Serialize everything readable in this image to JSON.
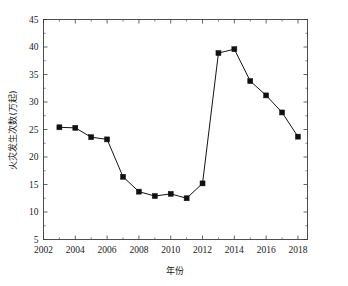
{
  "chart_data": {
    "type": "line",
    "title": "",
    "xlabel": "年份",
    "ylabel": "火灾发生次数(万起)",
    "x": [
      2003,
      2004,
      2005,
      2006,
      2007,
      2008,
      2009,
      2010,
      2011,
      2012,
      2013,
      2014,
      2015,
      2016,
      2017,
      2018
    ],
    "values": [
      25.4,
      25.3,
      23.6,
      23.2,
      16.4,
      13.7,
      12.9,
      13.3,
      12.5,
      15.2,
      38.9,
      39.6,
      33.8,
      31.2,
      28.1,
      23.7
    ],
    "series": [
      {
        "name": "火灾发生次数(万起)",
        "values": [
          25.4,
          25.3,
          23.6,
          23.2,
          16.4,
          13.7,
          12.9,
          13.3,
          12.5,
          15.2,
          38.9,
          39.6,
          33.8,
          31.2,
          28.1,
          23.7
        ]
      }
    ],
    "xlim": [
      2002,
      2018.6
    ],
    "ylim": [
      5,
      45
    ],
    "xticks": [
      2002,
      2004,
      2006,
      2008,
      2010,
      2012,
      2014,
      2016,
      2018
    ],
    "xtick_labels": [
      "2002",
      "2004",
      "2006",
      "2008",
      "2010",
      "2012",
      "2014",
      "2016",
      "2018"
    ],
    "yticks": [
      5,
      10,
      15,
      20,
      25,
      30,
      35,
      40,
      45
    ],
    "ytick_labels": [
      "5",
      "10",
      "15",
      "20",
      "25",
      "30",
      "35",
      "40",
      "45"
    ],
    "grid": false,
    "legend": "none",
    "marker": "square",
    "marker_color": "#101010",
    "line_color": "#141414"
  },
  "axis": {
    "x_title": "年份",
    "y_title": "火灾发生次数(万起)"
  }
}
